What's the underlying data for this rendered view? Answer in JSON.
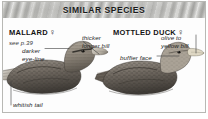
{
  "header": {
    "title": "SIMILAR SPECIES"
  },
  "species": [
    {
      "id": "mallard",
      "name": "MALLARD",
      "sex_symbol": "♀",
      "sex_name": "female-symbol",
      "reference": "see p.39"
    },
    {
      "id": "mottled",
      "name": "MOTTLED DUCK",
      "sex_symbol": "♀",
      "sex_name": "female-symbol",
      "reference": ""
    }
  ],
  "callouts": [
    {
      "id": "darker-eye-line",
      "line1": "darker",
      "line2": "eye-line"
    },
    {
      "id": "thicker-bill",
      "line1": "thicker",
      "line2": "longer bill"
    },
    {
      "id": "buffier-face",
      "line1": "buffier face",
      "line2": ""
    },
    {
      "id": "olive-bill",
      "line1": "olive to",
      "line2": "yellow bill"
    },
    {
      "id": "whitish-tail",
      "line1": "whitish tail",
      "line2": ""
    }
  ],
  "colors": {
    "panel_border": "#b8b8b4",
    "header_band": "#c2c2be",
    "text": "#141414",
    "leader_line": "#3c3c3c",
    "bird_dark": "#4a4642",
    "bird_mid": "#7b756d",
    "bird_light": "#b9b2a8",
    "bill_light": "#cfcabf"
  }
}
